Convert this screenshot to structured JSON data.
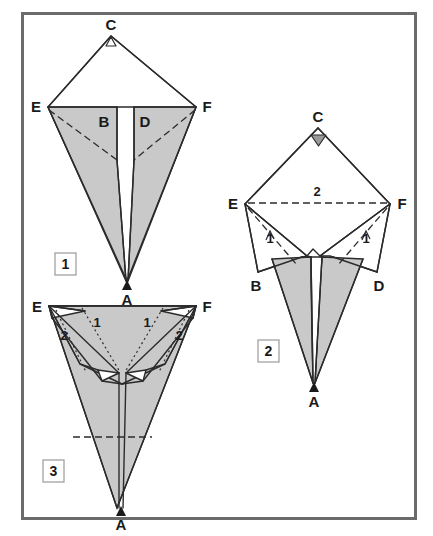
{
  "figure": {
    "frame_color": "#6b6b6b",
    "paper_front_color": "#c9c9c9",
    "paper_back_color": "#ffffff",
    "line_color": "#2b2b2b"
  },
  "steps": [
    {
      "number": "1",
      "vertex_labels": {
        "C": "C",
        "E": "E",
        "F": "F",
        "B": "B",
        "D": "D",
        "A": "A"
      },
      "markers": {
        "apex_marker": "open-triangle-up",
        "bottom_marker": "solid-triangle-up"
      },
      "fold_numbers": []
    },
    {
      "number": "2",
      "vertex_labels": {
        "C": "C",
        "E": "E",
        "F": "F",
        "B": "B",
        "D": "D",
        "A": "A"
      },
      "markers": {
        "apex_marker": "solid-triangle-down",
        "bottom_marker": "solid-triangle-up"
      },
      "fold_numbers": [
        {
          "label": "2",
          "position": "top-center",
          "kind": "valley-crease-EF"
        },
        {
          "label": "1",
          "position": "left-flap",
          "kind": "valley-crease-arrow"
        },
        {
          "label": "1",
          "position": "right-flap",
          "kind": "valley-crease-arrow"
        }
      ]
    },
    {
      "number": "3",
      "vertex_labels": {
        "E": "E",
        "F": "F",
        "A": "A"
      },
      "markers": {
        "bottom_marker": "solid-triangle-up"
      },
      "fold_numbers": [
        {
          "label": "2",
          "position": "upper-left",
          "kind": "dotted-crease"
        },
        {
          "label": "1",
          "position": "center-left",
          "kind": "dotted-crease"
        },
        {
          "label": "1",
          "position": "center-right",
          "kind": "dotted-crease"
        },
        {
          "label": "2",
          "position": "upper-right",
          "kind": "dotted-crease"
        }
      ]
    }
  ]
}
